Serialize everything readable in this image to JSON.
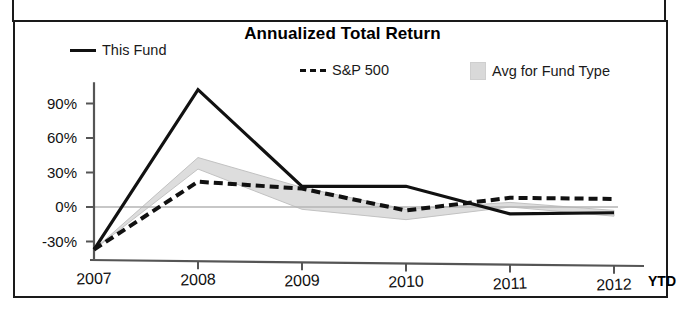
{
  "panel": {
    "title": "Annualized Total Return"
  },
  "legend": [
    {
      "key": "this_fund",
      "label": "This Fund",
      "marker": "solid-line-swatch"
    },
    {
      "key": "sp500",
      "label": "S&P 500",
      "marker": "dashed-line-swatch"
    },
    {
      "key": "avg_type",
      "label": "Avg for Fund Type",
      "marker": "shaded-area-swatch"
    }
  ],
  "axis": {
    "x_suffix": "YTD",
    "y_ticks": [
      "90%",
      "60%",
      "30%",
      "0%",
      "-30%"
    ],
    "x_ticks": [
      "2007",
      "2008",
      "2009",
      "2010",
      "2011",
      "2012"
    ]
  },
  "colors": {
    "this_fund": "#111111",
    "sp500": "#111111",
    "avg_band_fill": "#dcdcdc",
    "avg_band_stroke": "#bfbfbf",
    "axis": "#555555",
    "panel_border": "#1a1a1a",
    "text": "#111111"
  },
  "chart_data": {
    "type": "line",
    "title": "Annualized Total Return",
    "xlabel": "",
    "ylabel": "",
    "x": [
      "2007",
      "2008",
      "2009",
      "2010",
      "2011",
      "2012"
    ],
    "x_note": "2012 is YTD",
    "ylim": [
      -40,
      105
    ],
    "ytick_values": [
      90,
      60,
      30,
      0,
      -30
    ],
    "ytick_labels": [
      "90%",
      "60%",
      "30%",
      "0%",
      "-30%"
    ],
    "grid": false,
    "legend_position": "top",
    "zero_line": true,
    "series": [
      {
        "name": "This Fund",
        "style": "solid",
        "values": [
          -37,
          102,
          18,
          18,
          -6,
          -5
        ]
      },
      {
        "name": "S&P 500",
        "style": "dashed",
        "values": [
          -37,
          22,
          16,
          -3,
          8,
          7
        ]
      },
      {
        "name": "Avg for Fund Type",
        "style": "band",
        "upper": [
          -37,
          43,
          17,
          -2,
          4,
          -3
        ],
        "lower": [
          -37,
          33,
          -2,
          -11,
          0,
          -8
        ]
      }
    ]
  }
}
